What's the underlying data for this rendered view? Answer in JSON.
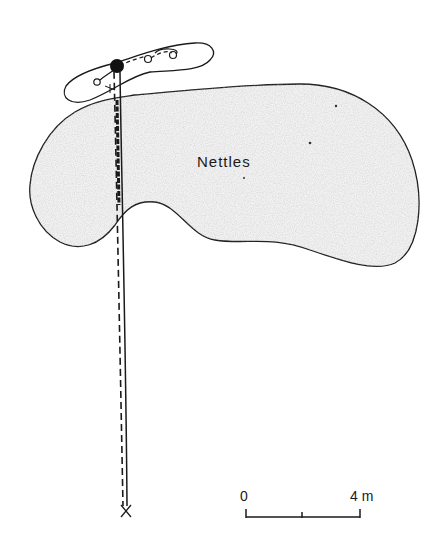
{
  "figure": {
    "area_label": "Nettles",
    "colors": {
      "ink": "#1a1a1a",
      "patch_fill": "#f1f1f1",
      "background": "#ffffff"
    },
    "markers": {
      "start": "cross-marker",
      "target": "filled-circle-marker",
      "small_loops": "open-circle-markers"
    },
    "paths": {
      "outbound": "dashed-line",
      "return": "solid-line"
    }
  },
  "scale_bar": {
    "min_label": "0",
    "max_label": "4 m",
    "length_m": 4,
    "ticks": 3
  }
}
